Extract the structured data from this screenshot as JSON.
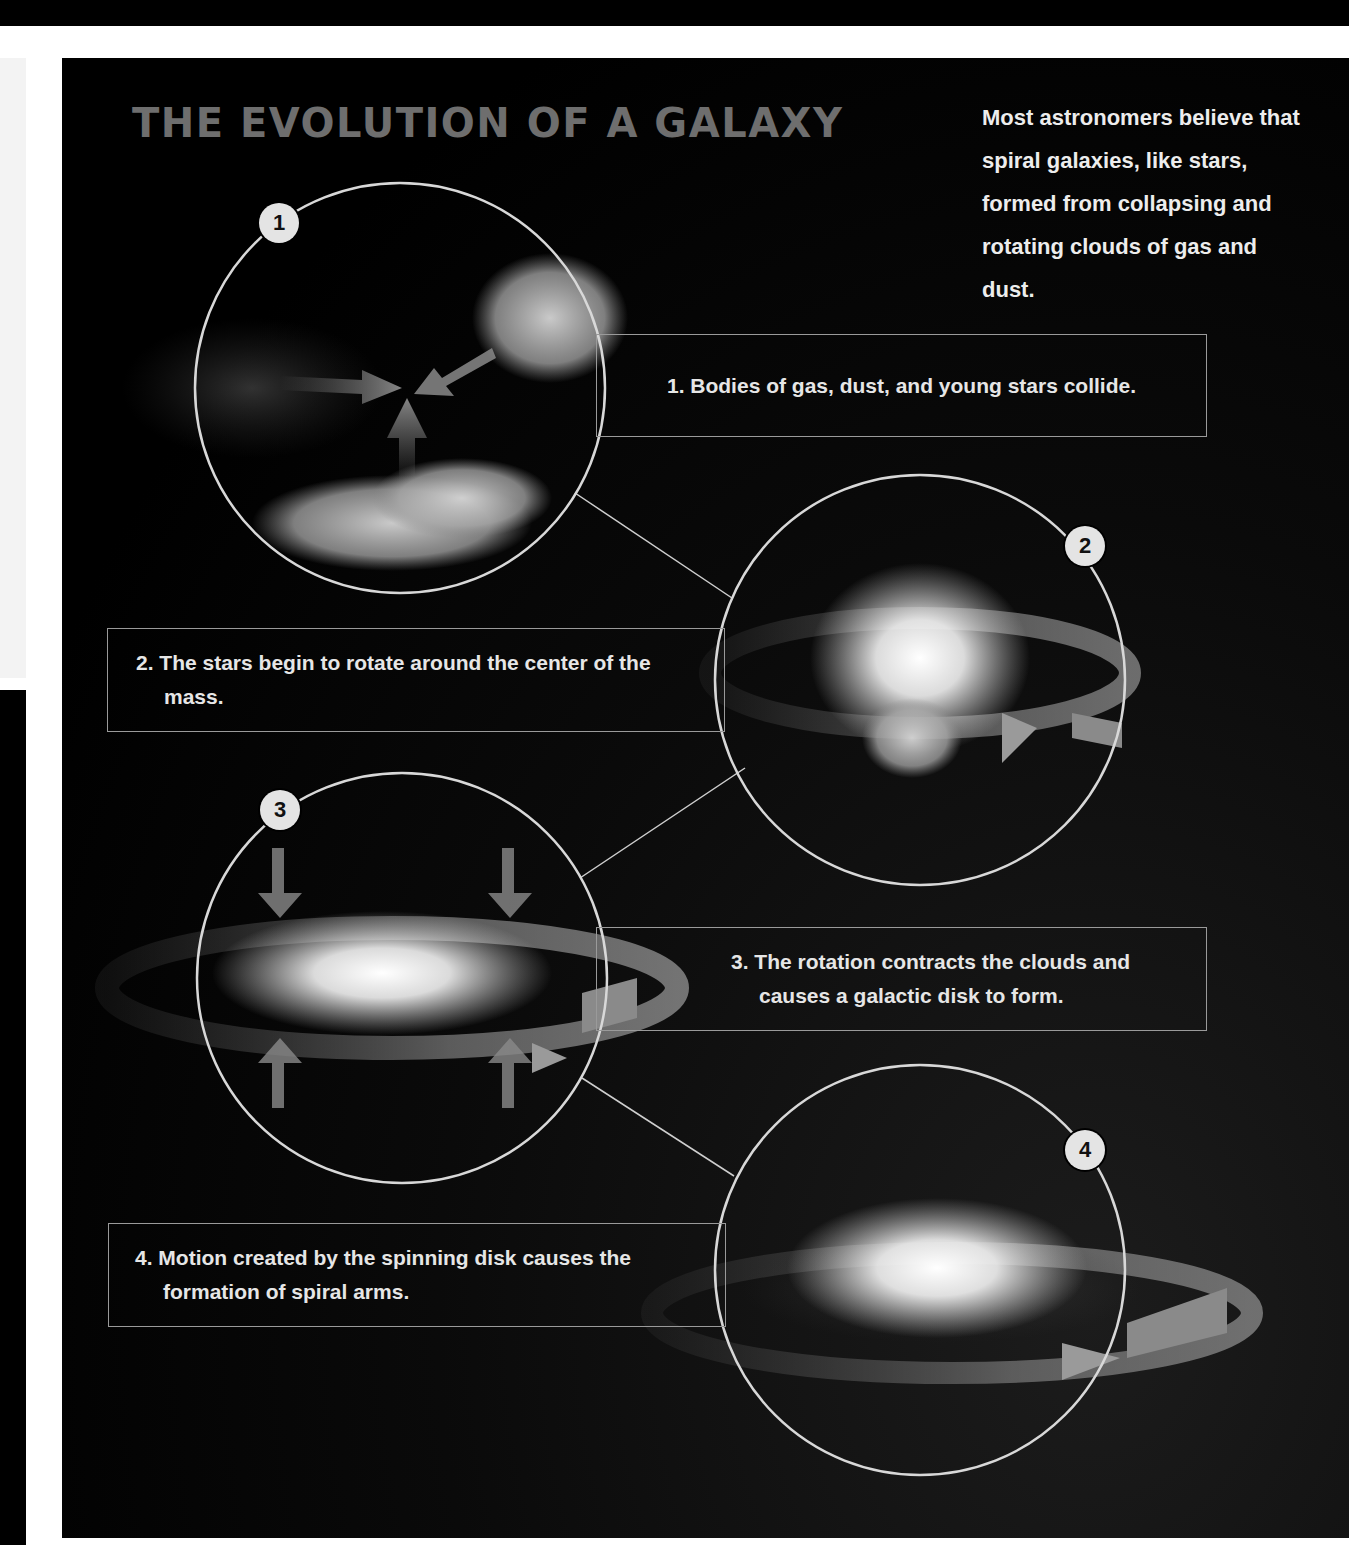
{
  "title": "THE EVOLUTION OF A GALAXY",
  "intro": "Most astronomers believe that spiral galaxies, like stars, formed from collapsing and rotating clouds of gas and dust.",
  "colors": {
    "background": "#000000",
    "title": "#6e6e6e",
    "text": "#e6e6e6",
    "circle_outline": "#d8d8d8",
    "rotation_arrow": "#8a8a8a",
    "badge": "#e4e4e4"
  },
  "stages": [
    {
      "number": "1",
      "caption": "1. Bodies of gas, dust, and young stars collide.",
      "illustration": "colliding-clouds"
    },
    {
      "number": "2",
      "caption": "2. The stars begin to rotate around the center of the mass.",
      "illustration": "rotating-cloud"
    },
    {
      "number": "3",
      "caption": "3. The rotation contracts the clouds and causes a galactic disk to form.",
      "illustration": "contracting-disk"
    },
    {
      "number": "4",
      "caption": "4. Motion created by the spinning disk causes the formation of spiral arms.",
      "illustration": "spiral-galaxy"
    }
  ]
}
